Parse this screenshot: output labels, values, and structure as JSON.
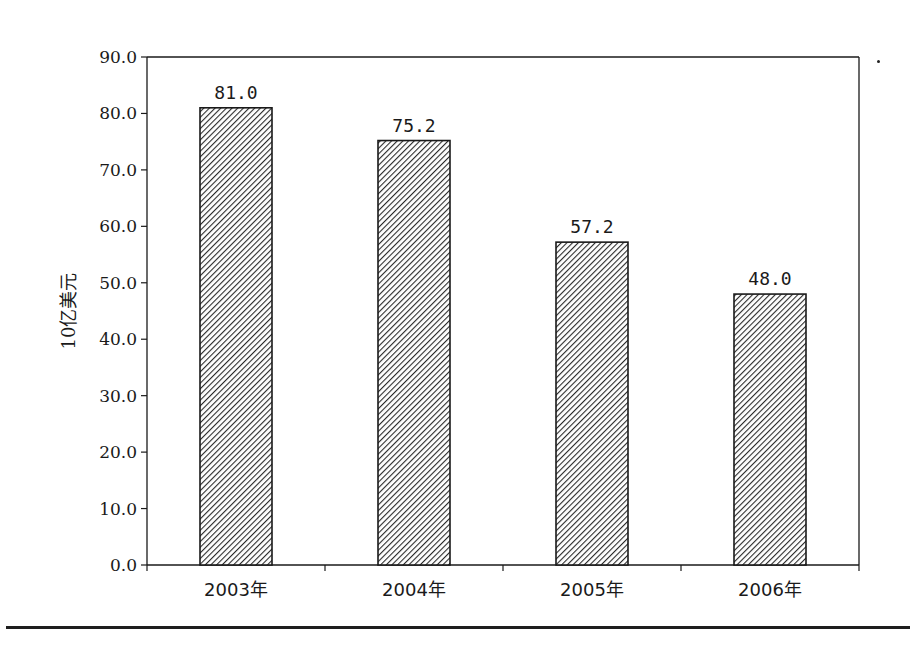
{
  "chart_data": {
    "type": "bar",
    "title": "",
    "xlabel": "",
    "ylabel": "10亿美元",
    "categories": [
      "2003年",
      "2004年",
      "2005年",
      "2006年"
    ],
    "values": [
      81.0,
      75.2,
      57.2,
      48.0
    ],
    "value_labels": [
      "81.0",
      "75.2",
      "57.2",
      "48.0"
    ],
    "ylim": [
      0,
      90
    ],
    "yticks": [
      0,
      10,
      20,
      30,
      40,
      50,
      60,
      70,
      80,
      90
    ],
    "ytick_labels": [
      "0.0",
      "10.0",
      "20.0",
      "30.0",
      "40.0",
      "50.0",
      "60.0",
      "70.0",
      "80.0",
      "90.0"
    ],
    "grid": false,
    "legend": null,
    "bar_fill": "diagonal-hatch",
    "colors": {
      "bar_line": "#1a1a1a",
      "hatch": "#2a2a2a",
      "axis": "#1a1a1a"
    }
  }
}
